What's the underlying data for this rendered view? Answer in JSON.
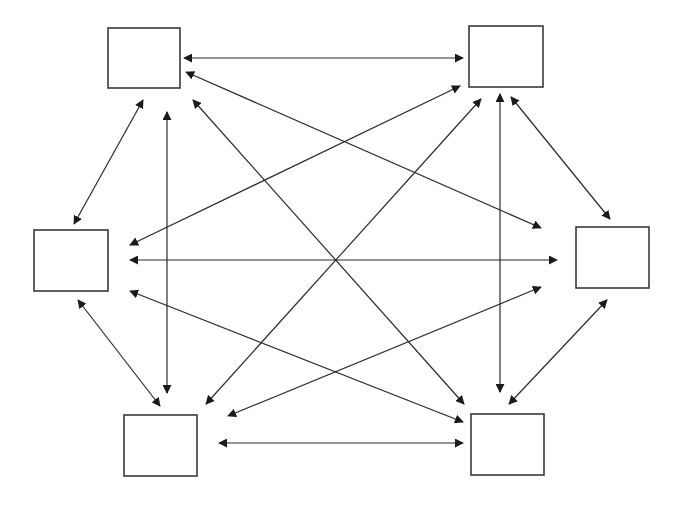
{
  "diagram": {
    "type": "complete-graph",
    "node_count": 6,
    "colors": {
      "stroke": "#2a2a2a",
      "box_border": "#3a3a3a",
      "background": "#ffffff"
    },
    "nodes": [
      {
        "id": "top-left",
        "x": 108,
        "y": 28,
        "w": 72,
        "h": 60,
        "label": ""
      },
      {
        "id": "top-right",
        "x": 469,
        "y": 26,
        "w": 74,
        "h": 61,
        "label": ""
      },
      {
        "id": "middle-left",
        "x": 34,
        "y": 230,
        "w": 74,
        "h": 61,
        "label": ""
      },
      {
        "id": "middle-right",
        "x": 576,
        "y": 227,
        "w": 73,
        "h": 61,
        "label": ""
      },
      {
        "id": "bottom-left",
        "x": 124,
        "y": 415,
        "w": 73,
        "h": 61,
        "label": ""
      },
      {
        "id": "bottom-right",
        "x": 471,
        "y": 414,
        "w": 73,
        "h": 61,
        "label": ""
      }
    ],
    "edges": [
      {
        "from": "top-left",
        "to": "top-right",
        "x1": 184,
        "y1": 58,
        "x2": 463,
        "y2": 58
      },
      {
        "from": "top-left",
        "to": "middle-right",
        "x1": 186,
        "y1": 72,
        "x2": 541,
        "y2": 228
      },
      {
        "from": "top-left",
        "to": "bottom-right",
        "x1": 193,
        "y1": 100,
        "x2": 464,
        "y2": 404
      },
      {
        "from": "top-left",
        "to": "middle-left",
        "x1": 143,
        "y1": 100,
        "x2": 74,
        "y2": 224
      },
      {
        "from": "top-left",
        "to": "bottom-left",
        "x1": 167,
        "y1": 112,
        "x2": 167,
        "y2": 393
      },
      {
        "from": "top-right",
        "to": "middle-left",
        "x1": 460,
        "y1": 86,
        "x2": 130,
        "y2": 245
      },
      {
        "from": "top-right",
        "to": "bottom-left",
        "x1": 481,
        "y1": 99,
        "x2": 206,
        "y2": 404
      },
      {
        "from": "top-right",
        "to": "bottom-right",
        "x1": 500,
        "y1": 94,
        "x2": 500,
        "y2": 392
      },
      {
        "from": "top-right",
        "to": "middle-right",
        "x1": 511,
        "y1": 97,
        "x2": 610,
        "y2": 219
      },
      {
        "from": "middle-left",
        "to": "middle-right",
        "x1": 130,
        "y1": 260,
        "x2": 557,
        "y2": 260
      },
      {
        "from": "middle-left",
        "to": "bottom-right",
        "x1": 130,
        "y1": 291,
        "x2": 463,
        "y2": 422
      },
      {
        "from": "middle-left",
        "to": "bottom-left",
        "x1": 78,
        "y1": 300,
        "x2": 160,
        "y2": 406
      },
      {
        "from": "middle-right",
        "to": "bottom-left",
        "x1": 541,
        "y1": 287,
        "x2": 228,
        "y2": 416
      },
      {
        "from": "middle-right",
        "to": "bottom-right",
        "x1": 607,
        "y1": 300,
        "x2": 509,
        "y2": 404
      },
      {
        "from": "bottom-left",
        "to": "bottom-right",
        "x1": 219,
        "y1": 443,
        "x2": 463,
        "y2": 443
      }
    ]
  }
}
